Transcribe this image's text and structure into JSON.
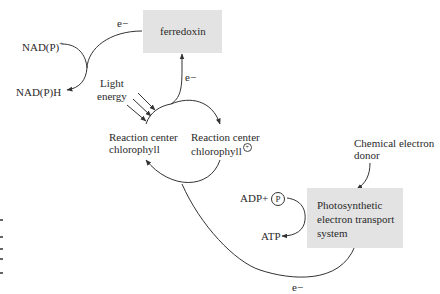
{
  "diagram": {
    "type": "electron-flow-cycle",
    "nodes": {
      "ferredoxin": "ferredoxin",
      "etc_box": [
        "Photosynthetic",
        "electron transport",
        "system"
      ],
      "rc_chlorophyll": [
        "Reaction center",
        "chlorophyll"
      ],
      "rc_chlorophyll_ox": [
        "Reaction center",
        "chlorophyll"
      ],
      "rc_ox_charge": "+",
      "nadp_plus": "NAD(P)",
      "nadp_plus_sup": "+",
      "nadph": "NAD(P)H",
      "light": [
        "Light",
        "energy"
      ],
      "chem_donor": [
        "Chemical electron",
        "donor"
      ],
      "adp": "ADP+",
      "phosphate": "P",
      "atp": "ATP"
    },
    "edges": {
      "e1": "e−",
      "e2": "e−",
      "e3": "e−"
    },
    "colors": {
      "box_fill": "#e3e3e3",
      "line": "#333333"
    }
  }
}
